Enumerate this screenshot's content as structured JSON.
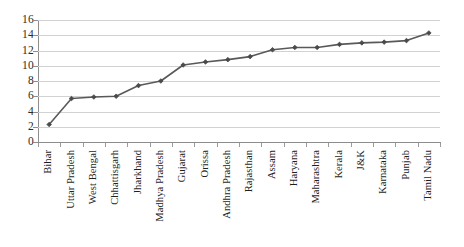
{
  "chart_data": {
    "type": "line",
    "title": "",
    "subtitle": "",
    "xlabel": "",
    "ylabel": "",
    "ylim": [
      0,
      16
    ],
    "yticks": [
      0,
      2,
      4,
      6,
      8,
      10,
      12,
      14,
      16
    ],
    "grid": true,
    "legend": false,
    "legend_position": "none",
    "marker": "diamond",
    "line_color": "#595959",
    "marker_color": "#4a4a4a",
    "grid_color": "#d2d2d2",
    "axis_color": "#8d8d8d",
    "background_color": "#ffffff",
    "categories": [
      "Bihar",
      "Uttar Pradesh",
      "West Bengal",
      "Chhattisgarh",
      "Jharkhand",
      "Madhya Pradesh",
      "Gujarat",
      "Orissa",
      "Andhra Pradesh",
      "Rajasthan",
      "Assam",
      "Haryana",
      "Maharashtra",
      "Kerala",
      "J&K",
      "Karnataka",
      "Punjab",
      "Tamil Nadu"
    ],
    "values": [
      2.3,
      5.7,
      5.9,
      6.0,
      7.4,
      8.0,
      10.1,
      10.5,
      10.8,
      11.2,
      12.1,
      12.4,
      12.4,
      12.8,
      13.0,
      13.1,
      13.3,
      14.3
    ]
  }
}
